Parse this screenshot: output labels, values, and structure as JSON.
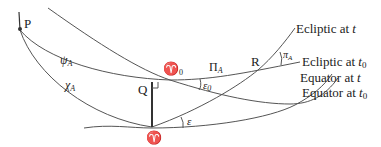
{
  "diagram": {
    "points": {
      "pole": "P",
      "q": "Q",
      "r": "R",
      "equinox_t": "♈",
      "equinox_t0_symbol": "♈",
      "equinox_t0_sub": "0"
    },
    "angles": {
      "psi": "ψ",
      "psi_sub": "A",
      "chi": "χ",
      "chi_sub": "A",
      "Pi": "Π",
      "Pi_sub": "A",
      "pi": "π",
      "pi_sub": "A",
      "eps0": "ε",
      "eps0_sub": "0",
      "eps": "ε"
    },
    "curve_labels": {
      "ecliptic_t_prefix": "Ecliptic at ",
      "ecliptic_t_var": "t",
      "ecliptic_t0_prefix": "Ecliptic at ",
      "ecliptic_t0_var": "t",
      "ecliptic_t0_sub": "0",
      "equator_t_prefix": "Equator at ",
      "equator_t_var": "t",
      "equator_t0_prefix": "Equator at ",
      "equator_t0_var": "t",
      "equator_t0_sub": "0"
    }
  }
}
